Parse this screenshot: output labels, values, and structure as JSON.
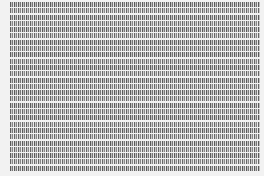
{
  "document": {
    "type": "scanned dense character grid",
    "rows": 27,
    "note": "text too small to be legible"
  }
}
